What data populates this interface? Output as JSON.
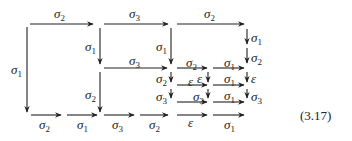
{
  "diagram": {
    "type": "commutative-diagram",
    "equation_number": "(3.17)",
    "color": "#222222",
    "arrows": [
      {
        "id": "top-1",
        "dir": "right",
        "x1": 30,
        "y1": 24,
        "x2": 93,
        "y2": 24,
        "label": "σ",
        "sub": "2",
        "lx": 54,
        "ly": 7
      },
      {
        "id": "top-2",
        "dir": "right",
        "x1": 104,
        "y1": 24,
        "x2": 168,
        "y2": 24,
        "label": "σ",
        "sub": "3",
        "lx": 129,
        "ly": 7
      },
      {
        "id": "top-3",
        "dir": "right",
        "x1": 177,
        "y1": 24,
        "x2": 244,
        "y2": 24,
        "label": "σ",
        "sub": "2",
        "lx": 204,
        "ly": 7
      },
      {
        "id": "left-v",
        "dir": "down",
        "x1": 27,
        "y1": 27,
        "x2": 27,
        "y2": 112,
        "label": "σ",
        "sub": "1",
        "lx": 11,
        "ly": 63
      },
      {
        "id": "mid-v1",
        "dir": "down",
        "x1": 100,
        "y1": 28,
        "x2": 100,
        "y2": 64,
        "label": "σ",
        "sub": "1",
        "lx": 85,
        "ly": 40
      },
      {
        "id": "mid-v2",
        "dir": "down",
        "x1": 171,
        "y1": 28,
        "x2": 171,
        "y2": 64,
        "label": "σ",
        "sub": "1",
        "lx": 156,
        "ly": 40
      },
      {
        "id": "row2-1",
        "dir": "right",
        "x1": 104,
        "y1": 68,
        "x2": 167,
        "y2": 68,
        "label": "σ",
        "sub": "3",
        "lx": 129,
        "ly": 54
      },
      {
        "id": "row2-2",
        "dir": "right",
        "x1": 177,
        "y1": 68,
        "x2": 207,
        "y2": 68,
        "label": "σ",
        "sub": "2",
        "lx": 186,
        "ly": 56
      },
      {
        "id": "row2-3",
        "dir": "right",
        "x1": 213,
        "y1": 68,
        "x2": 244,
        "y2": 68,
        "label": "σ",
        "sub": "1",
        "lx": 224,
        "ly": 56
      },
      {
        "id": "mid-v3",
        "dir": "down",
        "x1": 100,
        "y1": 72,
        "x2": 100,
        "y2": 112,
        "label": "σ",
        "sub": "2",
        "lx": 85,
        "ly": 88
      },
      {
        "id": "right-v1",
        "dir": "down",
        "x1": 247,
        "y1": 29,
        "x2": 247,
        "y2": 44,
        "label": "σ",
        "sub": "1",
        "lx": 251,
        "ly": 31
      },
      {
        "id": "right-v2",
        "dir": "down",
        "x1": 247,
        "y1": 48,
        "x2": 247,
        "y2": 63,
        "label": "σ",
        "sub": "2",
        "lx": 251,
        "ly": 51
      },
      {
        "id": "right-v3",
        "dir": "down",
        "x1": 247,
        "y1": 72,
        "x2": 247,
        "y2": 82,
        "label": "ε",
        "sub": "",
        "lx": 251,
        "ly": 72
      },
      {
        "id": "right-v4",
        "dir": "down",
        "x1": 247,
        "y1": 89,
        "x2": 247,
        "y2": 98,
        "label": "σ",
        "sub": "3",
        "lx": 251,
        "ly": 90
      },
      {
        "id": "c171-v1",
        "dir": "down",
        "x1": 171,
        "y1": 72,
        "x2": 171,
        "y2": 82,
        "label": "σ",
        "sub": "2",
        "lx": 156,
        "ly": 72
      },
      {
        "id": "c208-v1",
        "dir": "down",
        "x1": 208,
        "y1": 72,
        "x2": 208,
        "y2": 82,
        "label": "ε",
        "sub": "",
        "lx": 197,
        "ly": 72
      },
      {
        "id": "row3-1",
        "dir": "right",
        "x1": 177,
        "y1": 85,
        "x2": 207,
        "y2": 85,
        "label": "ε",
        "sub": "",
        "lx": 188,
        "ly": 75
      },
      {
        "id": "row3-2",
        "dir": "right",
        "x1": 213,
        "y1": 85,
        "x2": 244,
        "y2": 85,
        "label": "σ",
        "sub": "1",
        "lx": 224,
        "ly": 72
      },
      {
        "id": "c171-v2",
        "dir": "down",
        "x1": 171,
        "y1": 89,
        "x2": 171,
        "y2": 98,
        "label": "σ",
        "sub": "3",
        "lx": 156,
        "ly": 90
      },
      {
        "id": "c208-v2",
        "dir": "down",
        "x1": 208,
        "y1": 89,
        "x2": 208,
        "y2": 98,
        "label": "σ",
        "sub": "3",
        "lx": 193,
        "ly": 90
      },
      {
        "id": "row4-1",
        "dir": "right",
        "x1": 177,
        "y1": 102,
        "x2": 207,
        "y2": 102,
        "label": "",
        "sub": "",
        "lx": 0,
        "ly": 0
      },
      {
        "id": "row4-2",
        "dir": "right",
        "x1": 213,
        "y1": 102,
        "x2": 244,
        "y2": 102,
        "label": "σ",
        "sub": "1",
        "lx": 224,
        "ly": 89
      },
      {
        "id": "bot-1",
        "dir": "right",
        "x1": 31,
        "y1": 115,
        "x2": 61,
        "y2": 115,
        "label": "σ",
        "sub": "2",
        "lx": 39,
        "ly": 118
      },
      {
        "id": "bot-2",
        "dir": "right",
        "x1": 67,
        "y1": 115,
        "x2": 97,
        "y2": 115,
        "label": "σ",
        "sub": "1",
        "lx": 77,
        "ly": 118
      },
      {
        "id": "bot-3",
        "dir": "right",
        "x1": 104,
        "y1": 115,
        "x2": 134,
        "y2": 115,
        "label": "σ",
        "sub": "3",
        "lx": 112,
        "ly": 118
      },
      {
        "id": "bot-4",
        "dir": "right",
        "x1": 140,
        "y1": 115,
        "x2": 168,
        "y2": 115,
        "label": "σ",
        "sub": "2",
        "lx": 149,
        "ly": 118
      },
      {
        "id": "bot-5",
        "dir": "right",
        "x1": 177,
        "y1": 115,
        "x2": 207,
        "y2": 115,
        "label": "ε",
        "sub": "",
        "lx": 188,
        "ly": 116
      },
      {
        "id": "bot-6",
        "dir": "right",
        "x1": 213,
        "y1": 115,
        "x2": 244,
        "y2": 115,
        "label": "σ",
        "sub": "1",
        "lx": 224,
        "ly": 118
      }
    ]
  }
}
